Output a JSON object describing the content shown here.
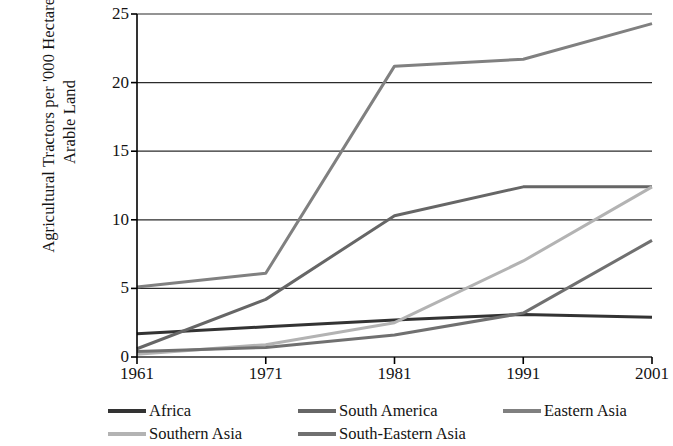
{
  "chart_data": {
    "type": "line",
    "title": "",
    "subtitle": "",
    "xlabel": "",
    "ylabel": "Agricultural Tractors per '000 Hectares\nArable Land",
    "categories": [
      "1961",
      "1971",
      "1981",
      "1991",
      "2001"
    ],
    "x": [
      1961,
      1971,
      1981,
      1991,
      2001
    ],
    "ylim": [
      0,
      25
    ],
    "xlim": [
      1961,
      2001
    ],
    "yticks": [
      0,
      5,
      10,
      15,
      20,
      25
    ],
    "ytick_labels": [
      "0",
      "5",
      "10",
      "15",
      "20",
      "25"
    ],
    "grid": "horizontal",
    "legend_position": "bottom",
    "series": [
      {
        "name": "Africa",
        "color": "#333333",
        "values": [
          1.7,
          2.2,
          2.7,
          3.1,
          2.9
        ]
      },
      {
        "name": "South America",
        "color": "#666666",
        "values": [
          0.6,
          4.2,
          10.3,
          12.4,
          12.4
        ]
      },
      {
        "name": "Eastern Asia",
        "color": "#808080",
        "values": [
          5.1,
          6.1,
          21.2,
          21.7,
          24.3
        ]
      },
      {
        "name": "Southern Asia",
        "color": "#b3b3b3",
        "values": [
          0.2,
          0.9,
          2.5,
          7.0,
          12.4
        ]
      },
      {
        "name": "South-Eastern Asia",
        "color": "#707070",
        "values": [
          0.4,
          0.7,
          1.6,
          3.2,
          8.5
        ]
      }
    ]
  },
  "axis": {
    "line_color": "#000000",
    "grid_color": "#2b2b2b"
  }
}
